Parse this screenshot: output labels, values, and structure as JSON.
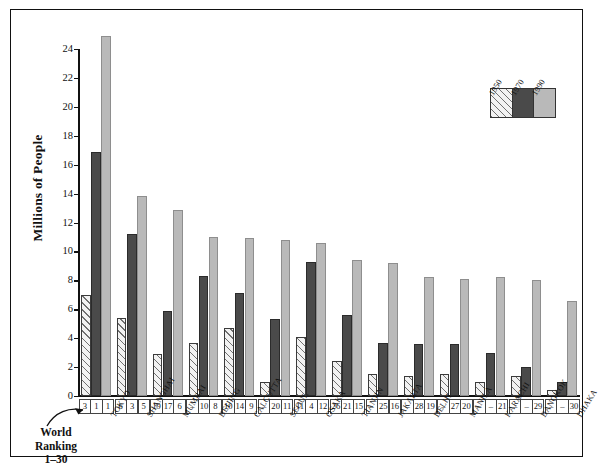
{
  "chart_data": {
    "type": "bar",
    "title": "",
    "xlabel": "",
    "ylabel": "Millions of People",
    "ylim": [
      0,
      24
    ],
    "ytick_step": 2,
    "yticks": [
      0,
      2,
      4,
      6,
      8,
      10,
      12,
      14,
      16,
      18,
      20,
      22,
      24
    ],
    "grid": false,
    "legend_position": "top-right",
    "categories": [
      "TOKYO",
      "SHANGHAI",
      "MUMBAI",
      "BEIJING",
      "CALCUTTA",
      "SEOUL",
      "OSAKA",
      "TIANJIN",
      "JAKARTA",
      "DELHI",
      "MANILA",
      "KARACHI",
      "BANGKOK",
      "DHAKA"
    ],
    "series": [
      {
        "name": "1950",
        "fill": "hatched",
        "values": [
          7.0,
          5.4,
          2.9,
          3.7,
          4.7,
          1.0,
          4.1,
          2.4,
          1.5,
          1.4,
          1.5,
          1.0,
          1.4,
          0.4
        ]
      },
      {
        "name": "1970",
        "fill": "dark-gray",
        "color": "#4a4a4a",
        "values": [
          16.9,
          11.2,
          5.9,
          8.3,
          7.1,
          5.3,
          9.3,
          5.6,
          3.7,
          3.6,
          3.6,
          3.0,
          2.0,
          1.0
        ]
      },
      {
        "name": "1990",
        "fill": "light-gray",
        "color": "#b9b9b9",
        "values": [
          24.9,
          13.8,
          12.9,
          11.0,
          10.9,
          10.8,
          10.6,
          9.4,
          9.2,
          8.2,
          8.1,
          8.2,
          8.0,
          6.6
        ]
      }
    ],
    "annotations": {
      "world_ranking_caption": [
        "World",
        "Ranking",
        "1–30"
      ],
      "ranking_header_note": "World Ranking 1–30"
    },
    "world_ranking": [
      {
        "city": "TOKYO",
        "r1950": "3",
        "r1970": "1",
        "r1990": "1"
      },
      {
        "city": "SHANGHAI",
        "r1950": "6",
        "r1970": "3",
        "r1990": "5"
      },
      {
        "city": "MUMBAI",
        "r1950": "19",
        "r1970": "17",
        "r1990": "6"
      },
      {
        "city": "BEIJING",
        "r1950": "–",
        "r1970": "10",
        "r1990": "8"
      },
      {
        "city": "CALCUTTA",
        "r1950": "10",
        "r1970": "14",
        "r1990": "9"
      },
      {
        "city": "SEOUL",
        "r1950": "–",
        "r1970": "20",
        "r1990": "11"
      },
      {
        "city": "OSAKA",
        "r1950": "11",
        "r1970": "4",
        "r1990": "12"
      },
      {
        "city": "TIANJIN",
        "r1950": "26",
        "r1970": "21",
        "r1990": "15"
      },
      {
        "city": "JAKARTA",
        "r1950": "–",
        "r1970": "25",
        "r1990": "16"
      },
      {
        "city": "DELHI",
        "r1950": "–",
        "r1970": "28",
        "r1990": "19"
      },
      {
        "city": "MANILA",
        "r1950": "–",
        "r1970": "27",
        "r1990": "20"
      },
      {
        "city": "KARACHI",
        "r1950": "–",
        "r1970": "–",
        "r1990": "21"
      },
      {
        "city": "BANGKOK",
        "r1950": "–",
        "r1970": "–",
        "r1990": "29"
      },
      {
        "city": "DHAKA",
        "r1950": "–",
        "r1970": "–",
        "r1990": "30"
      }
    ],
    "legend": [
      {
        "label": "1950",
        "fill": "hatched"
      },
      {
        "label": "1970",
        "fill": "dark-gray"
      },
      {
        "label": "1990",
        "fill": "light-gray"
      }
    ]
  }
}
